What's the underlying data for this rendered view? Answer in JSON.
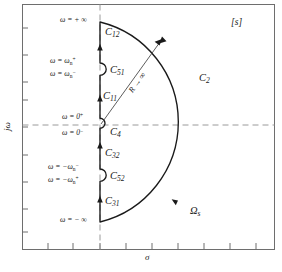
{
  "figure": {
    "plane_label": "[s]",
    "x_axis_label": "σ",
    "y_axis_label": "jω",
    "radius_label": "R → ∞",
    "contour_label": "Ω",
    "contour_label_sub": "s",
    "caption": ""
  },
  "omega_labels": [
    {
      "id": "omega-plus-infinity",
      "text": "ω = + ∞"
    },
    {
      "id": "omega-wn-plus",
      "text": "ω = ω",
      "sub": "n",
      "sup": "+"
    },
    {
      "id": "omega-wn-minus",
      "text": "ω = ω",
      "sub": "n",
      "sup": "−"
    },
    {
      "id": "omega-zero-plus",
      "text": "ω = 0",
      "sub": "",
      "sup": "+"
    },
    {
      "id": "omega-zero-minus",
      "text": "ω = 0",
      "sub": "",
      "sup": "−"
    },
    {
      "id": "omega-neg-wn-minus",
      "text": "ω = −ω",
      "sub": "n",
      "sup": "−"
    },
    {
      "id": "omega-neg-wn-plus",
      "text": "ω = −ω",
      "sub": "n",
      "sup": "+"
    },
    {
      "id": "omega-minus-infinity",
      "text": "ω = − ∞"
    }
  ],
  "contour_segments": [
    {
      "id": "C12",
      "letter": "C",
      "sub": "12"
    },
    {
      "id": "C51",
      "letter": "C",
      "sub": "51"
    },
    {
      "id": "C11",
      "letter": "C",
      "sub": "11"
    },
    {
      "id": "C4",
      "letter": "C",
      "sub": "4"
    },
    {
      "id": "C32",
      "letter": "C",
      "sub": "32"
    },
    {
      "id": "C52",
      "letter": "C",
      "sub": "52"
    },
    {
      "id": "C31",
      "letter": "C",
      "sub": "31"
    },
    {
      "id": "C2",
      "letter": "C",
      "sub": "2"
    }
  ],
  "colors": {
    "line": "#1a1a1a",
    "frame": "#6e6e6e",
    "dashed_axis": "#9a9a9a",
    "background": "#ffffff"
  }
}
